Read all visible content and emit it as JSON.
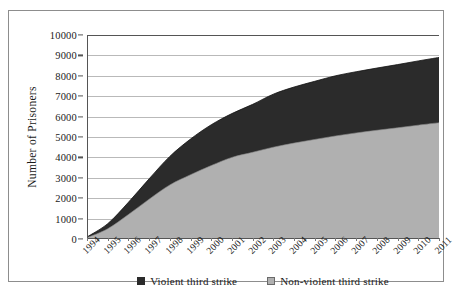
{
  "chart_data": {
    "type": "area",
    "title": "",
    "subtitle": "",
    "xlabel": "",
    "ylabel": "Number of Prisoners",
    "stacked": true,
    "grid": true,
    "legend_position": "bottom",
    "xlim": [
      1994,
      2011
    ],
    "ylim": [
      0,
      10000
    ],
    "ytick_labels": [
      "10000",
      "9000",
      "8000",
      "7000",
      "6000",
      "5000",
      "4000",
      "3000",
      "2000",
      "1000",
      "0"
    ],
    "ytick_values": [
      10000,
      9000,
      8000,
      7000,
      6000,
      5000,
      4000,
      3000,
      2000,
      1000,
      0
    ],
    "categories": [
      "1994",
      "1995",
      "1996",
      "1997",
      "1998",
      "1999",
      "2000",
      "2001",
      "2002",
      "2003",
      "2004",
      "2005",
      "2006",
      "2007",
      "2008",
      "2009",
      "2010",
      "2011"
    ],
    "series": [
      {
        "name": "Non-violent third strike",
        "color": "#b0b0b0",
        "values": [
          60,
          500,
          1200,
          1950,
          2650,
          3150,
          3600,
          4000,
          4250,
          4500,
          4700,
          4880,
          5050,
          5200,
          5330,
          5450,
          5580,
          5700
        ]
      },
      {
        "name": "Violent third strike",
        "color": "#2b2b2b",
        "values": [
          40,
          250,
          600,
          1000,
          1400,
          1750,
          2000,
          2150,
          2350,
          2600,
          2750,
          2850,
          2950,
          3000,
          3050,
          3100,
          3150,
          3200
        ]
      }
    ],
    "totals": [
      100,
      750,
      1800,
      2950,
      4050,
      4900,
      5600,
      6150,
      6600,
      7100,
      7450,
      7730,
      8000,
      8200,
      8380,
      8550,
      8730,
      8900
    ]
  },
  "legend": {
    "entries": [
      {
        "label": "Violent third strike",
        "swatch": "violent-swatch"
      },
      {
        "label": "Non-violent third strike",
        "swatch": "nonviolent-swatch"
      }
    ]
  },
  "colors": {
    "violent": "#2b2b2b",
    "nonviolent": "#b0b0b0",
    "gridline": "#b9b9b9",
    "axis": "#555555",
    "frame": "#8d8d8d",
    "background": "#ffffff"
  }
}
